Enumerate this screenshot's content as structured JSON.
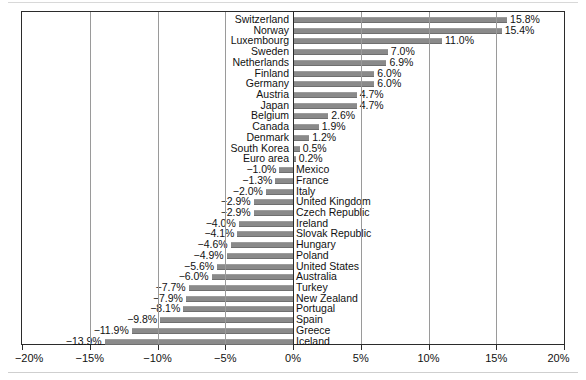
{
  "chart_data": {
    "type": "bar",
    "orientation": "horizontal",
    "title": "",
    "subtitle": "",
    "xlabel": "",
    "ylabel": "",
    "xlim": [
      -20,
      20
    ],
    "xticks": [
      -20,
      -15,
      -10,
      -5,
      0,
      5,
      10,
      15,
      20
    ],
    "xticklabels": [
      "−20%",
      "−15%",
      "−10%",
      "−5%",
      "0%",
      "5%",
      "10%",
      "15%",
      "20%"
    ],
    "grid": true,
    "gridlines_at": [
      -15,
      -10,
      -5,
      5,
      10,
      15
    ],
    "zero_line": 0,
    "legend": null,
    "bar_color": "#8a8a8a",
    "categories": [
      "Switzerland",
      "Norway",
      "Luxembourg",
      "Sweden",
      "Netherlands",
      "Finland",
      "Germany",
      "Austria",
      "Japan",
      "Belgium",
      "Canada",
      "Denmark",
      "South Korea",
      "Euro area",
      "Mexico",
      "France",
      "Italy",
      "United Kingdom",
      "Czech Republic",
      "Ireland",
      "Slovak Republic",
      "Hungary",
      "Poland",
      "United States",
      "Australia",
      "Turkey",
      "New Zealand",
      "Portugal",
      "Spain",
      "Greece",
      "Iceland"
    ],
    "values": [
      15.8,
      15.4,
      11.0,
      7.0,
      6.9,
      6.0,
      6.0,
      4.7,
      4.7,
      2.6,
      1.9,
      1.2,
      0.5,
      0.2,
      -1.0,
      -1.3,
      -2.0,
      -2.9,
      -2.9,
      -4.0,
      -4.1,
      -4.6,
      -4.9,
      -5.6,
      -6.0,
      -7.7,
      -7.9,
      -8.1,
      -9.8,
      -11.9,
      -13.9
    ],
    "value_labels": [
      "15.8%",
      "15.4%",
      "11.0%",
      "7.0%",
      "6.9%",
      "6.0%",
      "6.0%",
      "4.7%",
      "4.7%",
      "2.6%",
      "1.9%",
      "1.2%",
      "0.5%",
      "0.2%",
      "−1.0%",
      "−1.3%",
      "−2.0%",
      "−2.9%",
      "−2.9%",
      "−4.0%",
      "−4.1%",
      "−4.6%",
      "−4.9%",
      "−5.6%",
      "−6.0%",
      "−7.7%",
      "−7.9%",
      "−8.1%",
      "−9.8%",
      "−11.9%",
      "−13.9%"
    ]
  }
}
